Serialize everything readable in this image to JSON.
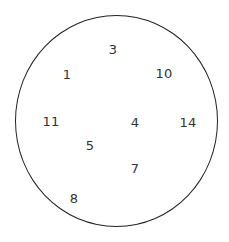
{
  "diagram": {
    "type": "set-diagram",
    "boundary": {
      "shape": "ellipse",
      "left": 15,
      "top": 15,
      "width": 203,
      "height": 212,
      "stroke_color": "#222222"
    },
    "text_color": "#333333",
    "elements": [
      {
        "label": "3",
        "x": 113,
        "y": 49
      },
      {
        "label": "1",
        "x": 67,
        "y": 74
      },
      {
        "label": "10",
        "x": 164,
        "y": 73
      },
      {
        "label": "11",
        "x": 51,
        "y": 121
      },
      {
        "label": "4",
        "x": 135,
        "y": 122
      },
      {
        "label": "14",
        "x": 188,
        "y": 122
      },
      {
        "label": "5",
        "x": 90,
        "y": 145
      },
      {
        "label": "7",
        "x": 135,
        "y": 168
      },
      {
        "label": "8",
        "x": 74,
        "y": 198
      }
    ]
  }
}
